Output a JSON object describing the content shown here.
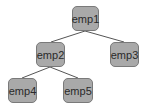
{
  "diagram": {
    "type": "tree",
    "node_fill": "#a9a9a9",
    "node_border": "#7a7a7a",
    "edge_color": "#555555",
    "nodes": [
      {
        "id": "emp1",
        "label": "emp1",
        "x": 72,
        "y": 6,
        "w": 27,
        "h": 25
      },
      {
        "id": "emp2",
        "label": "emp2",
        "x": 36,
        "y": 42,
        "w": 29,
        "h": 25
      },
      {
        "id": "emp3",
        "label": "emp3",
        "x": 110,
        "y": 42,
        "w": 29,
        "h": 25
      },
      {
        "id": "emp4",
        "label": "emp4",
        "x": 8,
        "y": 78,
        "w": 29,
        "h": 25
      },
      {
        "id": "emp5",
        "label": "emp5",
        "x": 63,
        "y": 78,
        "w": 30,
        "h": 25
      }
    ],
    "edges": [
      {
        "from": "emp1",
        "to": "emp2"
      },
      {
        "from": "emp1",
        "to": "emp3"
      },
      {
        "from": "emp2",
        "to": "emp4"
      },
      {
        "from": "emp2",
        "to": "emp5"
      }
    ]
  }
}
